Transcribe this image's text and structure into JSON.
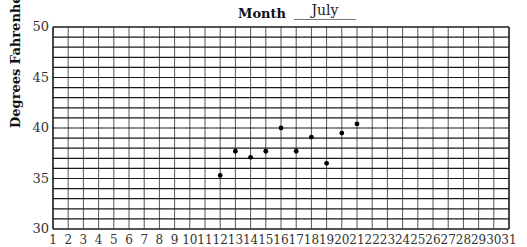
{
  "header": {
    "month_label": "Month",
    "month_value": "July"
  },
  "chart_data": {
    "type": "scatter",
    "xlabel": "",
    "ylabel": "Degrees Fahrenheit",
    "xlim": [
      1,
      31
    ],
    "ylim": [
      30,
      50
    ],
    "x_ticks": [
      1,
      2,
      3,
      4,
      5,
      6,
      7,
      8,
      9,
      10,
      11,
      12,
      13,
      14,
      15,
      16,
      17,
      18,
      19,
      20,
      21,
      22,
      23,
      24,
      25,
      26,
      27,
      28,
      29,
      30,
      31
    ],
    "y_ticks": [
      30,
      35,
      40,
      45,
      50
    ],
    "grid": true,
    "grid_x_step": 1,
    "grid_y_step": 1,
    "legend": null,
    "points": [
      {
        "x": 12,
        "y": 35.3
      },
      {
        "x": 13,
        "y": 37.7
      },
      {
        "x": 14,
        "y": 37.1
      },
      {
        "x": 15,
        "y": 37.7
      },
      {
        "x": 16,
        "y": 40.0
      },
      {
        "x": 17,
        "y": 37.7
      },
      {
        "x": 18,
        "y": 39.1
      },
      {
        "x": 19,
        "y": 36.5
      },
      {
        "x": 20,
        "y": 39.5
      },
      {
        "x": 21,
        "y": 40.4
      }
    ]
  },
  "colors": {
    "grid": "#1a1a1a",
    "grid_light": "#9a9a9a",
    "point": "#000000",
    "text": "#111111"
  }
}
